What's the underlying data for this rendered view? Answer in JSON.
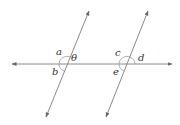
{
  "diagram": {
    "colors": {
      "line": "#8a8a8a",
      "arrow": "#6a6a6a",
      "arc": "#9a9a9a",
      "label": "#333333",
      "background": "#ffffff"
    },
    "horizontal_line": {
      "x1": 12,
      "y1": 64,
      "x2": 172,
      "y2": 64
    },
    "slanted_lines": [
      {
        "name": "left",
        "top": {
          "x": 89,
          "y": 11
        },
        "bottom": {
          "x": 46,
          "y": 117
        },
        "intersection": {
          "x": 67,
          "y": 64
        }
      },
      {
        "name": "right",
        "top": {
          "x": 148,
          "y": 11
        },
        "bottom": {
          "x": 106,
          "y": 117
        },
        "intersection": {
          "x": 127,
          "y": 64
        }
      }
    ],
    "labels": {
      "a": "a",
      "theta": "θ",
      "b": "b",
      "c": "c",
      "d": "d",
      "e": "e"
    }
  }
}
